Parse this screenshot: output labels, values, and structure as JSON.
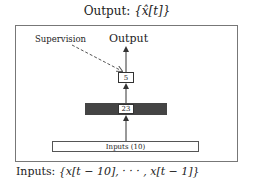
{
  "title": {
    "prefix": "Output: ",
    "math": "{x̂[t]}"
  },
  "diagram": {
    "supervision_label": "Supervision",
    "output_label": "Output",
    "output_node": "5",
    "hidden_node": "23",
    "input_layer": "Inputs (10)"
  },
  "footer": {
    "prefix": "Inputs: ",
    "math": "{x[t − 10], · · · , x[t − 1]}"
  },
  "colors": {
    "hidden_layer": "#444444",
    "frame": "#777777"
  }
}
